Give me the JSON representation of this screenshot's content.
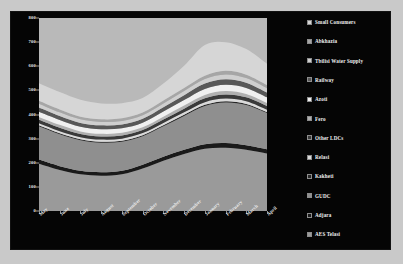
{
  "chart_data": {
    "type": "area",
    "stacked": true,
    "title": "",
    "subtitle": "",
    "xlabel": "",
    "ylabel": "",
    "ylim": [
      0,
      800
    ],
    "ytick_labels": [
      "0",
      "100",
      "200",
      "300",
      "400",
      "500",
      "600",
      "700",
      "800"
    ],
    "ytick_values": [
      0,
      100,
      200,
      300,
      400,
      500,
      600,
      700,
      800
    ],
    "grid": false,
    "legend_position": "right",
    "categories": [
      "May",
      "June",
      "July",
      "August",
      "September",
      "October",
      "November",
      "December",
      "January",
      "February",
      "March",
      "April"
    ],
    "series": [
      {
        "name": "AES Telasi",
        "color": "#9a9a9a",
        "values": [
          196,
          170,
          152,
          146,
          152,
          176,
          208,
          236,
          258,
          262,
          254,
          238
        ]
      },
      {
        "name": "Adjara",
        "color": "#1a1a1a",
        "values": [
          17,
          16,
          15,
          15,
          15,
          16,
          17,
          18,
          19,
          20,
          19,
          18
        ]
      },
      {
        "name": "GUDC",
        "color": "#8f8f8f",
        "values": [
          138,
          132,
          126,
          122,
          120,
          118,
          126,
          140,
          158,
          168,
          166,
          150
        ]
      },
      {
        "name": "Kakheti",
        "color": "#262626",
        "values": [
          4,
          4,
          4,
          4,
          4,
          4,
          4,
          5,
          5,
          5,
          5,
          4
        ]
      },
      {
        "name": "Relasi",
        "color": "#dadada",
        "values": [
          9,
          9,
          9,
          9,
          9,
          9,
          10,
          10,
          11,
          11,
          11,
          10
        ]
      },
      {
        "name": "Other LDCs",
        "color": "#3a3a3a",
        "values": [
          14,
          14,
          13,
          13,
          13,
          13,
          14,
          15,
          16,
          17,
          16,
          15
        ]
      },
      {
        "name": "Fero",
        "color": "#b0b0b0",
        "values": [
          12,
          12,
          11,
          11,
          11,
          11,
          12,
          13,
          14,
          14,
          14,
          13
        ]
      },
      {
        "name": "Azoti",
        "color": "#f0f0f0",
        "values": [
          21,
          20,
          19,
          19,
          19,
          19,
          21,
          23,
          25,
          26,
          25,
          23
        ]
      },
      {
        "name": "Railway",
        "color": "#585858",
        "values": [
          18,
          17,
          16,
          16,
          16,
          16,
          18,
          20,
          22,
          23,
          22,
          20
        ]
      },
      {
        "name": "Tbilisi Water Supply",
        "color": "#cfcfcf",
        "values": [
          16,
          15,
          15,
          14,
          14,
          15,
          16,
          17,
          19,
          20,
          19,
          18
        ]
      },
      {
        "name": "Abkhazia",
        "color": "#a6a6a6",
        "values": [
          12,
          12,
          11,
          11,
          11,
          11,
          12,
          13,
          14,
          15,
          14,
          13
        ]
      },
      {
        "name": "Small Consumers",
        "color": "#d6d6d6",
        "values": [
          73,
          72,
          70,
          66,
          63,
          60,
          70,
          92,
          127,
          119,
          106,
          88
        ]
      }
    ]
  },
  "legend": {
    "items": [
      {
        "label": "Small Consumers",
        "color": "#d6d6d6"
      },
      {
        "label": "Abkhazia",
        "color": "#a6a6a6"
      },
      {
        "label": "Tbilisi Water Supply",
        "color": "#cfcfcf"
      },
      {
        "label": "Railway",
        "color": "#585858"
      },
      {
        "label": "Azoti",
        "color": "#f0f0f0"
      },
      {
        "label": "Fero",
        "color": "#b0b0b0"
      },
      {
        "label": "Other LDCs",
        "color": "#3a3a3a"
      },
      {
        "label": "Relasi",
        "color": "#dadada"
      },
      {
        "label": "Kakheti",
        "color": "#262626"
      },
      {
        "label": "GUDC",
        "color": "#8f8f8f"
      },
      {
        "label": "Adjara",
        "color": "#1a1a1a"
      },
      {
        "label": "AES Telasi",
        "color": "#9a9a9a"
      }
    ]
  },
  "colors": {
    "background": "#c9c9c9",
    "frame": "#050505",
    "plot_background": "#b9b9b9",
    "text": "#f0f0f0"
  }
}
